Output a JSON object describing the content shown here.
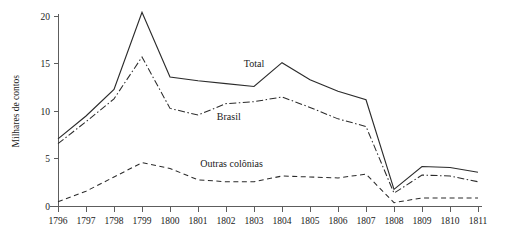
{
  "chart_data": {
    "type": "line",
    "title": "",
    "subtitle": "",
    "xlabel": "",
    "ylabel": "Milhares de contos",
    "x": [
      1796,
      1797,
      1798,
      1799,
      1800,
      1801,
      1802,
      1803,
      1804,
      1805,
      1806,
      1807,
      1808,
      1809,
      1810,
      1811
    ],
    "categories": [
      "1796",
      "1797",
      "1798",
      "1799",
      "1800",
      "1801",
      "1802",
      "1803",
      "1804",
      "1805",
      "1806",
      "1807",
      "1808",
      "1809",
      "1810",
      "1811"
    ],
    "xlim": [
      1796,
      1811
    ],
    "ylim": [
      0,
      20
    ],
    "yticks": [
      0,
      5,
      10,
      15,
      20
    ],
    "ytick_labels": [
      "0",
      "5",
      "10",
      "15",
      "20"
    ],
    "grid": false,
    "legend_position": "inline-annotations",
    "series": [
      {
        "name": "Total",
        "style": "solid",
        "color": "#2b2b2b",
        "values": [
          7.1,
          9.5,
          12.3,
          20.4,
          13.6,
          13.2,
          12.9,
          12.6,
          15.1,
          13.3,
          12.1,
          11.2,
          1.8,
          4.2,
          4.1,
          3.6
        ],
        "label_x": 1803.0,
        "label_y": 14.6
      },
      {
        "name": "Brasil",
        "style": "dash-dot",
        "color": "#2b2b2b",
        "values": [
          6.6,
          8.9,
          11.3,
          15.7,
          10.3,
          9.6,
          10.8,
          11.0,
          11.5,
          10.4,
          9.2,
          8.4,
          1.4,
          3.3,
          3.2,
          2.6
        ],
        "label_x": 1802.1,
        "label_y": 9.1
      },
      {
        "name": "Outras colônias",
        "style": "dashed",
        "color": "#2b2b2b",
        "values": [
          0.5,
          1.6,
          3.1,
          4.6,
          4.0,
          2.8,
          2.6,
          2.6,
          3.2,
          3.1,
          3.0,
          3.4,
          0.4,
          0.9,
          0.9,
          0.9
        ],
        "label_x": 1802.2,
        "label_y": 4.1
      }
    ],
    "annotations": [
      {
        "text": "Total",
        "series": "Total"
      },
      {
        "text": "Brasil",
        "series": "Brasil"
      },
      {
        "text": "Outras colônias",
        "series": "Outras colônias"
      }
    ]
  }
}
